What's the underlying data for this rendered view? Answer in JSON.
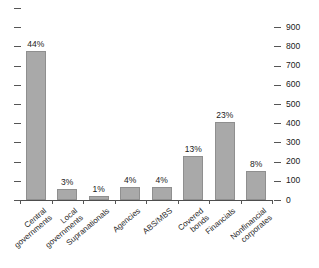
{
  "chart_data": {
    "type": "bar",
    "title": "",
    "subtitle": "",
    "xlabel": "",
    "ylabel": "",
    "categories": [
      "Central governments",
      "Local governments",
      "Supranationals",
      "Agencies",
      "ABS/MBS",
      "Covered bonds",
      "Financials",
      "Nonfinancial corporates"
    ],
    "values": [
      775,
      55,
      20,
      70,
      70,
      230,
      405,
      150
    ],
    "data_labels": [
      "44%",
      "3%",
      "1%",
      "4%",
      "4%",
      "13%",
      "23%",
      "8%"
    ],
    "percentages": [
      44,
      3,
      1,
      4,
      4,
      13,
      23,
      8
    ],
    "ylim": [
      0,
      1000
    ],
    "y_axis_position": "right",
    "yticks": [
      0,
      100,
      200,
      300,
      400,
      500,
      600,
      700,
      800,
      900
    ],
    "ytick_labels": [
      "0",
      "100",
      "200",
      "300",
      "400",
      "500",
      "600",
      "700",
      "800",
      "900"
    ],
    "grid": false,
    "legend": false,
    "legend_position": "none",
    "bar_color": "#a9a9a9",
    "bar_edge_color": "#8f8f8f",
    "axis_color": "#555555",
    "text_color": "#1a1a1a"
  }
}
